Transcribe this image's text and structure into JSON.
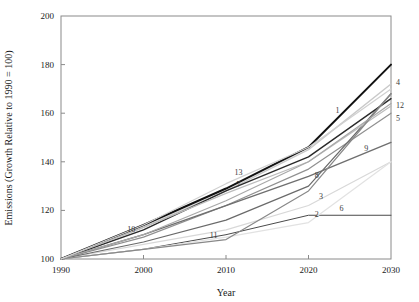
{
  "chart_data": {
    "type": "line",
    "title": "",
    "xlabel": "Year",
    "ylabel": "Emissions (Growth Relative to 1990 = 100)",
    "xlim": [
      1990,
      2030
    ],
    "ylim": [
      100,
      200
    ],
    "xticks": [
      1990,
      2000,
      2010,
      2020,
      2030
    ],
    "yticks": [
      100,
      120,
      140,
      160,
      180,
      200
    ],
    "grid": false,
    "legend_position": "inline-end-labels",
    "x": [
      1990,
      2000,
      2010,
      2020,
      2030
    ],
    "series": [
      {
        "name": "1",
        "label": "1",
        "color": "#c9c9c9",
        "width": 1.4,
        "values": [
          100,
          113,
          128,
          145,
          172
        ],
        "label_x": 2023.5,
        "label_y": 161.5
      },
      {
        "name": "2",
        "label": "2",
        "color": "#4a4a4a",
        "width": 1.0,
        "values": [
          100,
          104,
          110,
          118,
          118
        ],
        "label_x": 2021.0,
        "label_y": 118.5
      },
      {
        "name": "3",
        "label": "3",
        "color": "#d8d8d8",
        "width": 1.2,
        "values": [
          100,
          106,
          112,
          122,
          140
        ],
        "label_x": 2021.5,
        "label_y": 126.0
      },
      {
        "name": "4",
        "label": "4",
        "color": "#111111",
        "width": 2.0,
        "values": [
          100,
          114,
          129,
          146,
          180
        ],
        "label_x": 2031.5,
        "label_y": 173.0
      },
      {
        "name": "5",
        "label": "5",
        "color": "#909090",
        "width": 1.2,
        "values": [
          100,
          109,
          122,
          137,
          160
        ],
        "label_x": 2031.5,
        "label_y": 158.0
      },
      {
        "name": "6",
        "label": "6",
        "color": "#e2e2e2",
        "width": 1.2,
        "values": [
          100,
          104,
          109,
          115,
          140
        ],
        "label_x": 2024.0,
        "label_y": 121.0
      },
      {
        "name": "7",
        "label": "7",
        "color": "#2a2a2a",
        "width": 1.4,
        "values": [
          100,
          112,
          128,
          142,
          166
        ],
        "label_x": 2011.5,
        "label_y": 131.0
      },
      {
        "name": "8",
        "label": "8",
        "color": "#6a6a6a",
        "width": 1.2,
        "values": [
          100,
          107,
          116,
          130,
          168
        ],
        "label_x": 2021.0,
        "label_y": 134.5
      },
      {
        "name": "9",
        "label": "9",
        "color": "#6f6f6f",
        "width": 1.4,
        "values": [
          100,
          110,
          122,
          134,
          148
        ],
        "label_x": 2027.0,
        "label_y": 145.5
      },
      {
        "name": "10",
        "label": "10",
        "color": "#bcbcbc",
        "width": 1.2,
        "values": [
          100,
          113,
          127,
          140,
          163
        ],
        "label_x": 1998.5,
        "label_y": 112.5
      },
      {
        "name": "11",
        "label": "11",
        "color": "#888888",
        "width": 1.2,
        "values": [
          100,
          104,
          108,
          128,
          168
        ],
        "label_x": 2008.5,
        "label_y": 110.0
      },
      {
        "name": "12",
        "label": "12",
        "color": "#a8a8a8",
        "width": 1.2,
        "values": [
          100,
          110,
          124,
          140,
          164
        ],
        "label_x": 2031.5,
        "label_y": 163.5
      },
      {
        "name": "13",
        "label": "13",
        "color": "#d0d0d0",
        "width": 1.2,
        "values": [
          100,
          114,
          131,
          146,
          170
        ],
        "label_x": 2011.5,
        "label_y": 136.0
      }
    ]
  },
  "axes": {
    "xtick_labels": [
      "1990",
      "2000",
      "2010",
      "2020",
      "2030"
    ],
    "ytick_labels": [
      "100",
      "120",
      "140",
      "160",
      "180",
      "200"
    ],
    "x_title": "Year",
    "y_title": "Emissions (Growth Relative to 1990 = 100)"
  }
}
